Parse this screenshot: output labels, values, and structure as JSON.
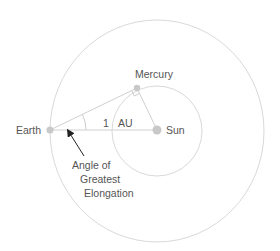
{
  "diagram": {
    "labels": {
      "earth": "Earth",
      "mercury": "Mercury",
      "sun": "Sun",
      "distance_value": "1",
      "distance_unit": "AU",
      "angle_line1": "Angle of",
      "angle_line2": "Greatest",
      "angle_line3": "Elongation"
    },
    "colors": {
      "orbit": "#d9d9d9",
      "line": "#cccccc",
      "body": "#c8c8c8",
      "text": "#555555",
      "arrow": "#222222"
    }
  }
}
